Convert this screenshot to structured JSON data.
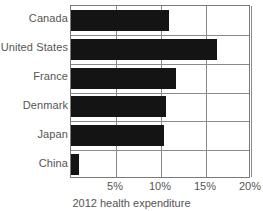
{
  "chart_data": {
    "type": "bar",
    "orientation": "horizontal",
    "title": "",
    "caption": "2012 health expenditure",
    "xlabel": "2012 health expenditure",
    "ylabel": "",
    "categories": [
      "Canada",
      "United States",
      "France",
      "Denmark",
      "Japan",
      "China"
    ],
    "values": [
      10.9,
      16.2,
      11.7,
      10.6,
      10.3,
      0.9
    ],
    "value_unit": "%",
    "xlim": [
      0,
      20
    ],
    "xticks": [
      5,
      10,
      15,
      20
    ],
    "xtick_labels": [
      "5%",
      "10%",
      "15%",
      "20%"
    ],
    "grid": "vertical-and-horizontal",
    "legend": "none",
    "bar_color": "#141414",
    "axis_color": "#7a7a7a",
    "grid_color": "#8a8a8a",
    "text_color": "#555555"
  },
  "axis": {
    "categories": [
      {
        "label": "Canada"
      },
      {
        "label": "United States"
      },
      {
        "label": "France"
      },
      {
        "label": "Denmark"
      },
      {
        "label": "Japan"
      },
      {
        "label": "China"
      }
    ],
    "ticks": [
      {
        "label": "5%"
      },
      {
        "label": "10%"
      },
      {
        "label": "15%"
      },
      {
        "label": "20%"
      }
    ]
  },
  "caption": {
    "text": "2012 health expenditure"
  }
}
